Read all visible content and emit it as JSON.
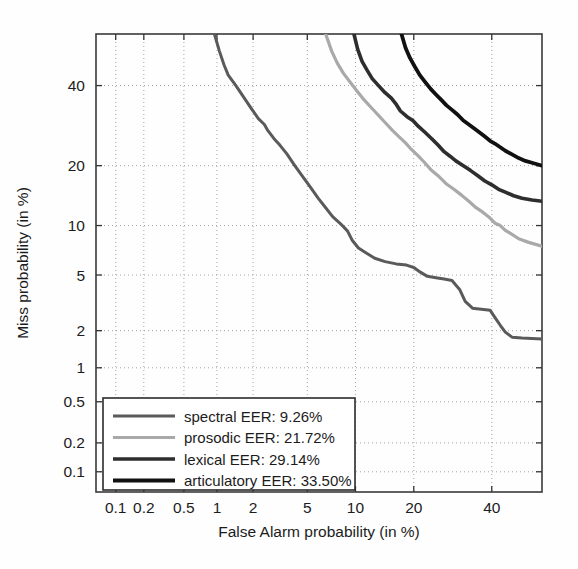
{
  "chart_data": {
    "type": "line",
    "title": "",
    "xlabel": "False Alarm probability (in %)",
    "ylabel": "Miss probability (in %)",
    "scale": "normal-deviate (DET)",
    "grid": true,
    "grid_style": "dotted",
    "xlim": [
      0.06,
      55
    ],
    "ylim": [
      0.06,
      55
    ],
    "xticks": [
      0.1,
      0.2,
      0.5,
      1,
      2,
      5,
      10,
      20,
      40
    ],
    "xticklabels": [
      "0.1",
      "0.2",
      "0.5",
      "1",
      "2",
      "5",
      "10",
      "20",
      "40"
    ],
    "yticks": [
      0.1,
      0.2,
      0.5,
      1,
      2,
      5,
      10,
      20,
      40
    ],
    "yticklabels": [
      "0.1",
      "0.2",
      "0.5",
      "1",
      "2",
      "5",
      "10",
      "20",
      "40"
    ],
    "legend_position": "lower-left",
    "series": [
      {
        "name": "spectral",
        "label": "spectral EER: 9.26%",
        "eer": 9.26,
        "color": "#5a5a5a",
        "linewidth": 3.0,
        "points": [
          [
            0.95,
            55.0
          ],
          [
            1.05,
            50.0
          ],
          [
            1.15,
            46.0
          ],
          [
            1.25,
            43.0
          ],
          [
            1.45,
            40.0
          ],
          [
            1.7,
            36.5
          ],
          [
            1.95,
            33.5
          ],
          [
            2.2,
            31.0
          ],
          [
            2.45,
            29.5
          ],
          [
            2.6,
            28.0
          ],
          [
            2.9,
            26.0
          ],
          [
            3.2,
            24.5
          ],
          [
            3.6,
            22.5
          ],
          [
            4.1,
            20.0
          ],
          [
            4.6,
            18.0
          ],
          [
            5.2,
            16.0
          ],
          [
            5.9,
            14.0
          ],
          [
            6.6,
            12.5
          ],
          [
            7.3,
            11.2
          ],
          [
            8.2,
            10.2
          ],
          [
            9.0,
            9.3
          ],
          [
            9.6,
            8.2
          ],
          [
            10.4,
            7.4
          ],
          [
            11.5,
            6.9
          ],
          [
            12.8,
            6.4
          ],
          [
            14.5,
            6.1
          ],
          [
            16.5,
            5.9
          ],
          [
            18.5,
            5.8
          ],
          [
            20.0,
            5.6
          ],
          [
            21.5,
            5.2
          ],
          [
            23.0,
            4.9
          ],
          [
            25.0,
            4.8
          ],
          [
            27.0,
            4.7
          ],
          [
            29.0,
            4.6
          ],
          [
            31.0,
            4.0
          ],
          [
            32.5,
            3.3
          ],
          [
            34.5,
            2.95
          ],
          [
            37.0,
            2.9
          ],
          [
            39.5,
            2.85
          ],
          [
            41.0,
            2.5
          ],
          [
            42.5,
            2.2
          ],
          [
            44.0,
            1.95
          ],
          [
            46.0,
            1.78
          ],
          [
            49.0,
            1.75
          ],
          [
            55.0,
            1.72
          ]
        ]
      },
      {
        "name": "prosodic",
        "label": "prosodic EER: 21.72%",
        "eer": 21.72,
        "color": "#a9a9a9",
        "linewidth": 3.2,
        "points": [
          [
            6.6,
            55.0
          ],
          [
            7.2,
            50.0
          ],
          [
            7.8,
            46.5
          ],
          [
            8.5,
            43.5
          ],
          [
            9.3,
            41.0
          ],
          [
            10.2,
            38.5
          ],
          [
            11.2,
            36.0
          ],
          [
            12.2,
            34.0
          ],
          [
            13.3,
            32.0
          ],
          [
            14.5,
            30.0
          ],
          [
            15.8,
            28.0
          ],
          [
            17.0,
            26.5
          ],
          [
            18.3,
            25.0
          ],
          [
            19.5,
            23.5
          ],
          [
            21.0,
            22.0
          ],
          [
            22.5,
            20.5
          ],
          [
            24.0,
            19.0
          ],
          [
            25.5,
            18.0
          ],
          [
            27.5,
            16.5
          ],
          [
            29.5,
            15.5
          ],
          [
            31.5,
            14.5
          ],
          [
            33.5,
            13.5
          ],
          [
            35.5,
            12.5
          ],
          [
            37.5,
            11.8
          ],
          [
            39.5,
            11.0
          ],
          [
            41.0,
            10.3
          ],
          [
            42.5,
            10.0
          ],
          [
            44.0,
            9.4
          ],
          [
            46.0,
            8.9
          ],
          [
            48.0,
            8.4
          ],
          [
            51.0,
            8.0
          ],
          [
            55.0,
            7.6
          ]
        ]
      },
      {
        "name": "lexical",
        "label": "lexical EER: 29.14%",
        "eer": 29.14,
        "color": "#2e2e2e",
        "linewidth": 3.6,
        "points": [
          [
            9.8,
            55.0
          ],
          [
            10.3,
            50.5
          ],
          [
            10.9,
            47.0
          ],
          [
            11.6,
            44.5
          ],
          [
            12.4,
            42.0
          ],
          [
            13.4,
            40.0
          ],
          [
            14.5,
            38.0
          ],
          [
            15.6,
            36.5
          ],
          [
            16.4,
            35.0
          ],
          [
            17.3,
            33.0
          ],
          [
            18.6,
            31.5
          ],
          [
            19.8,
            30.5
          ],
          [
            21.0,
            29.0
          ],
          [
            22.5,
            27.5
          ],
          [
            24.0,
            26.0
          ],
          [
            25.5,
            24.5
          ],
          [
            27.0,
            23.0
          ],
          [
            28.5,
            22.0
          ],
          [
            30.0,
            21.0
          ],
          [
            32.0,
            20.0
          ],
          [
            34.0,
            19.0
          ],
          [
            36.0,
            18.0
          ],
          [
            38.0,
            17.0
          ],
          [
            40.0,
            16.3
          ],
          [
            42.0,
            15.5
          ],
          [
            44.0,
            15.0
          ],
          [
            46.5,
            14.4
          ],
          [
            49.0,
            14.0
          ],
          [
            52.0,
            13.7
          ],
          [
            55.0,
            13.5
          ]
        ]
      },
      {
        "name": "articulatory",
        "label": "articulatory EER: 33.50%",
        "eer": 33.5,
        "color": "#111111",
        "linewidth": 3.8,
        "points": [
          [
            17.5,
            55.0
          ],
          [
            18.3,
            51.0
          ],
          [
            19.2,
            48.0
          ],
          [
            20.2,
            45.5
          ],
          [
            21.3,
            43.0
          ],
          [
            22.5,
            41.0
          ],
          [
            23.8,
            39.0
          ],
          [
            25.0,
            37.5
          ],
          [
            26.3,
            36.0
          ],
          [
            27.6,
            34.5
          ],
          [
            29.0,
            33.3
          ],
          [
            30.5,
            32.0
          ],
          [
            32.0,
            30.5
          ],
          [
            33.5,
            29.5
          ],
          [
            35.0,
            28.5
          ],
          [
            36.5,
            27.5
          ],
          [
            38.0,
            26.5
          ],
          [
            39.5,
            25.5
          ],
          [
            41.0,
            24.8
          ],
          [
            42.5,
            24.0
          ],
          [
            44.0,
            23.2
          ],
          [
            46.0,
            22.4
          ],
          [
            48.0,
            21.6
          ],
          [
            50.0,
            21.0
          ],
          [
            52.5,
            20.5
          ],
          [
            55.0,
            20.0
          ]
        ]
      }
    ]
  },
  "axes": {
    "y_title": "Miss probability (in %)",
    "x_title": "False Alarm probability (in %)"
  },
  "legend": {
    "items": [
      {
        "label": "spectral EER: 9.26%",
        "color": "#5a5a5a"
      },
      {
        "label": "prosodic EER: 21.72%",
        "color": "#a9a9a9"
      },
      {
        "label": "lexical EER: 29.14%",
        "color": "#2e2e2e"
      },
      {
        "label": "articulatory EER: 33.50%",
        "color": "#111111"
      }
    ]
  }
}
